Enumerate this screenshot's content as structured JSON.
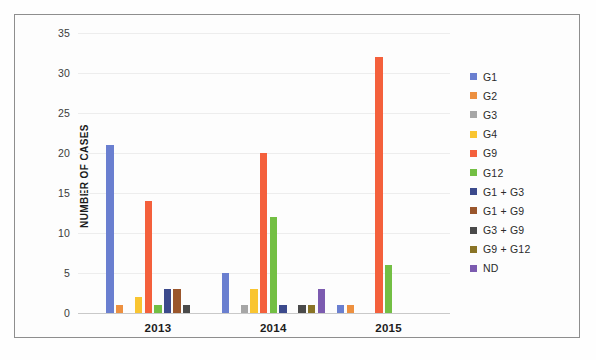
{
  "chart_data": {
    "type": "bar",
    "title": "",
    "subtitle": "",
    "xlabel": "",
    "ylabel": "NUMBER OF CASES",
    "categories": [
      "2013",
      "2014",
      "2015"
    ],
    "ylim": [
      0,
      35
    ],
    "yticks": [
      0,
      5,
      10,
      15,
      20,
      25,
      30,
      35
    ],
    "ytick_labels": [
      "0",
      "5",
      "10",
      "15",
      "20",
      "25",
      "30",
      "35"
    ],
    "grid": true,
    "grid_axis": "y",
    "legend_position": "right",
    "series": [
      {
        "name": "G1",
        "color": "#6a7fd0",
        "values": [
          21,
          5,
          1
        ]
      },
      {
        "name": "G2",
        "color": "#ed9040",
        "values": [
          1,
          0,
          1
        ]
      },
      {
        "name": "G3",
        "color": "#a6a6a6",
        "values": [
          0,
          1,
          0
        ]
      },
      {
        "name": "G4",
        "color": "#f9c531",
        "values": [
          2,
          3,
          0
        ]
      },
      {
        "name": "G9",
        "color": "#f4603c",
        "values": [
          14,
          20,
          32
        ]
      },
      {
        "name": "G12",
        "color": "#73bf44",
        "values": [
          1,
          12,
          6
        ]
      },
      {
        "name": "G1 + G3",
        "color": "#3c4a8c",
        "values": [
          3,
          1,
          0
        ]
      },
      {
        "name": "G1 + G9",
        "color": "#9a562c",
        "values": [
          3,
          0,
          0
        ]
      },
      {
        "name": "G3 + G9",
        "color": "#4a4a4a",
        "values": [
          1,
          1,
          0
        ]
      },
      {
        "name": "G9 + G12",
        "color": "#8a7426",
        "values": [
          0,
          1,
          0
        ]
      },
      {
        "name": "ND",
        "color": "#7c5bb0",
        "values": [
          0,
          3,
          0
        ]
      }
    ]
  },
  "axis": {
    "y_title": "NUMBER OF CASES",
    "y_tick_labels": [
      "35",
      "30",
      "25",
      "20",
      "15",
      "10",
      "5",
      "0"
    ],
    "x_tick_labels": [
      "2013",
      "2014",
      "2015"
    ]
  },
  "legend": {
    "items": [
      {
        "label": "G1",
        "color": "#6a7fd0"
      },
      {
        "label": "G2",
        "color": "#ed9040"
      },
      {
        "label": "G3",
        "color": "#a6a6a6"
      },
      {
        "label": "G4",
        "color": "#f9c531"
      },
      {
        "label": "G9",
        "color": "#f4603c"
      },
      {
        "label": "G12",
        "color": "#73bf44"
      },
      {
        "label": "G1 + G3",
        "color": "#3c4a8c"
      },
      {
        "label": "G1 + G9",
        "color": "#9a562c"
      },
      {
        "label": "G3 + G9",
        "color": "#4a4a4a"
      },
      {
        "label": "G9 + G12",
        "color": "#8a7426"
      },
      {
        "label": "ND",
        "color": "#7c5bb0"
      }
    ]
  },
  "style": {
    "frame_color": "#8e8e8e",
    "grid_color": "#ededed",
    "text_color": "#1c1c1c",
    "background": "#fdfdfd"
  }
}
